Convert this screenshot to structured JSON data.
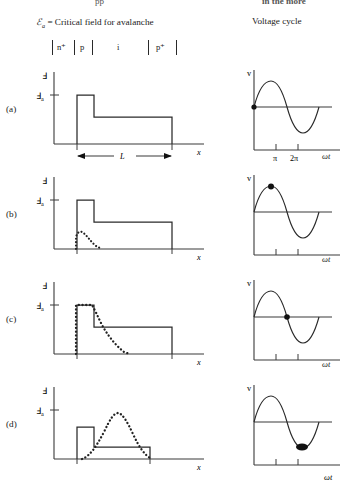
{
  "page": {
    "cropped_header_left": "pp",
    "cropped_header_right": "in the more"
  },
  "legend": {
    "symbol": "ℰ",
    "subscript": "a",
    "text": " = Critical field for avalanche"
  },
  "columns": {
    "right_heading": "Voltage cycle"
  },
  "device_layers": {
    "labels": [
      "n",
      "p",
      "i",
      "p"
    ],
    "superscripts": [
      "+",
      "",
      "",
      "+"
    ],
    "display": [
      "n⁺",
      "p",
      "i",
      "p⁺"
    ]
  },
  "axes": {
    "field_y_label": "ℰ",
    "field_y_tick_label": "ℰ",
    "field_y_tick_sub": "a",
    "field_x_label": "x",
    "voltage_y_label": "v",
    "voltage_x_label": "ωt",
    "voltage_ticks": [
      "π",
      "2π"
    ]
  },
  "dimension": {
    "label": "L"
  },
  "panels": [
    {
      "id": "a",
      "row_label": "(a)",
      "phase_marker_deg": 0,
      "phase_marker_label": "0",
      "has_dotted_carrier": false,
      "field_profile": "narrow avalanche spike at E_a then lower drift plateau",
      "voltage_marker_position": "zero crossing rising"
    },
    {
      "id": "b",
      "row_label": "(b)",
      "phase_marker_deg": 90,
      "phase_marker_label": "π/2",
      "has_dotted_carrier": true,
      "field_profile": "spike at E_a, drift plateau, small low carrier packet at junction",
      "voltage_marker_position": "positive peak"
    },
    {
      "id": "c",
      "row_label": "(c)",
      "phase_marker_deg": 180,
      "phase_marker_label": "π",
      "has_dotted_carrier": true,
      "field_profile": "carrier packet grown to E_a at junction, decaying into drift region",
      "voltage_marker_position": "zero crossing falling"
    },
    {
      "id": "d",
      "row_label": "(d)",
      "phase_marker_deg": 270,
      "phase_marker_label": "3π/2",
      "has_dotted_carrier": true,
      "field_profile": "reduced field, carrier packet drifted to mid drift region peaking near E_a",
      "voltage_marker_position": "negative trough"
    }
  ]
}
